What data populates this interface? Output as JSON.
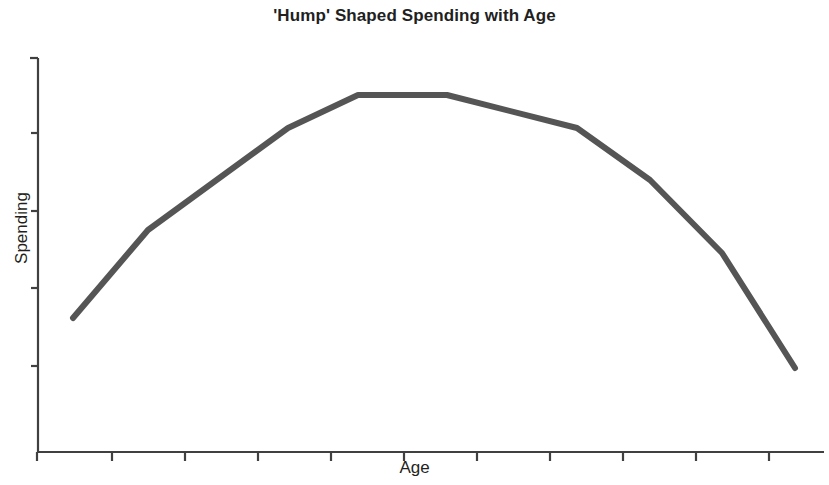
{
  "chart_data": {
    "type": "line",
    "title": "'Hump' Shaped Spending with Age",
    "xlabel": "Age",
    "ylabel": "Spending",
    "grid": false,
    "legend": null,
    "tick_labels": {
      "x": [],
      "y": []
    },
    "axis_style": {
      "x_ticks_count": 11,
      "y_ticks_count": 5,
      "axis_color": "#404040",
      "line_color": "#555555",
      "line_width": 6
    },
    "xlim": [
      0,
      10
    ],
    "ylim": [
      0,
      10
    ],
    "series": [
      {
        "name": "Spending",
        "x": [
          0.5,
          1.5,
          3.35,
          4.3,
          5.5,
          7.2,
          8.2,
          9.15,
          10.1
        ],
        "values": [
          3.4,
          5.65,
          8.25,
          9.1,
          9.1,
          8.25,
          6.9,
          5.05,
          2.15
        ],
        "points_px": [
          [
            73,
            318
          ],
          [
            148,
            230
          ],
          [
            288,
            128
          ],
          [
            358,
            95
          ],
          [
            447,
            95
          ],
          [
            577,
            128
          ],
          [
            650,
            180
          ],
          [
            722,
            253
          ],
          [
            795,
            368
          ]
        ]
      }
    ]
  },
  "colors": {
    "line": "#555555",
    "axis": "#404040",
    "title_text": "#221f1f",
    "label_text": "#231f20",
    "background": "#ffffff"
  }
}
